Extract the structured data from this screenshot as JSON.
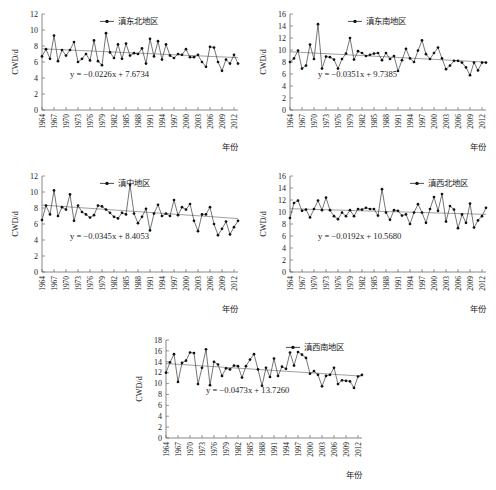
{
  "figure": {
    "background": "#ffffff",
    "axis_color": "#555555",
    "series_color": "#2b2b2b",
    "trend_color": "#777777",
    "marker_color": "#111111"
  },
  "common": {
    "ylabel": "CWD/d",
    "xlabel": "年份",
    "xtick_labels": [
      "1964",
      "1967",
      "1970",
      "1973",
      "1976",
      "1979",
      "1982",
      "1985",
      "1988",
      "1991",
      "1994",
      "1997",
      "2000",
      "2003",
      "2006",
      "2009",
      "2012"
    ],
    "xlim": [
      1964,
      2013
    ],
    "xtick_step": 3,
    "legend_marker": "line-with-dot-marker"
  },
  "chart_data": [
    {
      "id": "panel-1",
      "type": "line",
      "title": "",
      "legend": [
        "滇东北地区"
      ],
      "legend_position": "top-center",
      "xlabel": "年份",
      "ylabel": "CWD/d",
      "ylim": [
        0,
        12
      ],
      "ytick_labels": [
        "0",
        "2",
        "4",
        "6",
        "8",
        "10",
        "12"
      ],
      "ytick_step": 2,
      "grid": false,
      "equation": "y = −0.0226x + 7.6734",
      "trend": {
        "slope": -0.0226,
        "intercept": 7.6734,
        "x_origin": 1964
      },
      "x": [
        1964,
        1965,
        1966,
        1967,
        1968,
        1969,
        1970,
        1971,
        1972,
        1973,
        1974,
        1975,
        1976,
        1977,
        1978,
        1979,
        1980,
        1981,
        1982,
        1983,
        1984,
        1985,
        1986,
        1987,
        1988,
        1989,
        1990,
        1991,
        1992,
        1993,
        1994,
        1995,
        1996,
        1997,
        1998,
        1999,
        2000,
        2001,
        2002,
        2003,
        2004,
        2005,
        2006,
        2007,
        2008,
        2009,
        2010,
        2011,
        2012,
        2013
      ],
      "values": [
        6.7,
        7.6,
        6.4,
        9.3,
        6.1,
        7.5,
        6.8,
        7.5,
        8.5,
        6.0,
        6.4,
        7.0,
        6.2,
        8.7,
        6.1,
        5.6,
        9.6,
        7.2,
        6.5,
        8.2,
        6.4,
        8.3,
        6.8,
        7.1,
        7.0,
        7.7,
        5.8,
        8.9,
        6.7,
        8.6,
        6.3,
        8.2,
        6.8,
        6.5,
        7.0,
        6.9,
        7.6,
        6.6,
        6.6,
        6.9,
        6.0,
        5.4,
        7.9,
        7.8,
        6.0,
        4.9,
        6.3,
        5.8,
        6.9,
        5.8
      ]
    },
    {
      "id": "panel-2",
      "type": "line",
      "title": "",
      "legend": [
        "滇东南地区"
      ],
      "legend_position": "top-center",
      "xlabel": "年份",
      "ylabel": "CWD/d",
      "ylim": [
        0,
        16
      ],
      "ytick_labels": [
        "0",
        "2",
        "4",
        "6",
        "8",
        "10",
        "12",
        "14",
        "16"
      ],
      "ytick_step": 2,
      "grid": false,
      "equation": "y = −0.0351x + 9.7385",
      "trend": {
        "slope": -0.0351,
        "intercept": 9.7385,
        "x_origin": 1964
      },
      "x": [
        1964,
        1965,
        1966,
        1967,
        1968,
        1969,
        1970,
        1971,
        1972,
        1973,
        1974,
        1975,
        1976,
        1977,
        1978,
        1979,
        1980,
        1981,
        1982,
        1983,
        1984,
        1985,
        1986,
        1987,
        1988,
        1989,
        1990,
        1991,
        1992,
        1993,
        1994,
        1995,
        1996,
        1997,
        1998,
        1999,
        2000,
        2001,
        2002,
        2003,
        2004,
        2005,
        2006,
        2007,
        2008,
        2009,
        2010,
        2011,
        2012,
        2013
      ],
      "values": [
        8.0,
        8.6,
        9.9,
        6.9,
        7.4,
        10.9,
        8.5,
        14.3,
        6.9,
        8.9,
        8.8,
        8.4,
        6.9,
        8.5,
        9.4,
        12.0,
        8.4,
        9.8,
        9.5,
        9.0,
        9.2,
        9.4,
        9.5,
        8.3,
        9.5,
        8.5,
        9.0,
        6.5,
        8.3,
        10.2,
        8.6,
        8.0,
        9.9,
        11.6,
        9.3,
        8.5,
        9.5,
        10.4,
        8.6,
        6.8,
        7.4,
        8.2,
        8.2,
        7.9,
        7.1,
        5.8,
        7.9,
        6.6,
        7.9,
        7.9
      ]
    },
    {
      "id": "panel-3",
      "type": "line",
      "title": "",
      "legend": [
        "滇中地区"
      ],
      "legend_position": "top-center",
      "xlabel": "年份",
      "ylabel": "CWD/d",
      "ylim": [
        0,
        12
      ],
      "ytick_labels": [
        "0",
        "2",
        "4",
        "6",
        "8",
        "10",
        "12"
      ],
      "ytick_step": 2,
      "grid": false,
      "equation": "y = −0.0345x + 8.4053",
      "trend": {
        "slope": -0.0345,
        "intercept": 8.4053,
        "x_origin": 1964
      },
      "x": [
        1964,
        1965,
        1966,
        1967,
        1968,
        1969,
        1970,
        1971,
        1972,
        1973,
        1974,
        1975,
        1976,
        1977,
        1978,
        1979,
        1980,
        1981,
        1982,
        1983,
        1984,
        1985,
        1986,
        1987,
        1988,
        1989,
        1990,
        1991,
        1992,
        1993,
        1994,
        1995,
        1996,
        1997,
        1998,
        1999,
        2000,
        2001,
        2002,
        2003,
        2004,
        2005,
        2006,
        2007,
        2008,
        2009,
        2010,
        2011,
        2012,
        2013
      ],
      "values": [
        6.5,
        8.3,
        7.2,
        10.2,
        7.0,
        8.1,
        7.8,
        9.7,
        6.4,
        8.3,
        7.5,
        7.2,
        6.8,
        7.1,
        8.3,
        8.2,
        7.8,
        7.4,
        6.9,
        6.7,
        7.4,
        7.2,
        10.9,
        7.3,
        6.1,
        6.9,
        7.9,
        5.2,
        7.3,
        8.4,
        7.0,
        7.3,
        7.0,
        9.0,
        7.1,
        8.1,
        7.8,
        8.5,
        6.4,
        5.1,
        7.2,
        7.2,
        8.1,
        6.0,
        4.6,
        5.4,
        6.3,
        4.7,
        5.6,
        6.4
      ]
    },
    {
      "id": "panel-4",
      "type": "line",
      "title": "",
      "legend": [
        "滇西北地区"
      ],
      "legend_position": "top-right",
      "xlabel": "年份",
      "ylabel": "CWD/d",
      "ylim": [
        0,
        16
      ],
      "ytick_labels": [
        "0",
        "2",
        "4",
        "6",
        "8",
        "10",
        "12",
        "14",
        "16"
      ],
      "ytick_step": 2,
      "grid": false,
      "equation": "y = −0.0192x + 10.5680",
      "trend": {
        "slope": -0.0192,
        "intercept": 10.568,
        "x_origin": 1964
      },
      "x": [
        1964,
        1965,
        1966,
        1967,
        1968,
        1969,
        1970,
        1971,
        1972,
        1973,
        1974,
        1975,
        1976,
        1977,
        1978,
        1979,
        1980,
        1981,
        1982,
        1983,
        1984,
        1985,
        1986,
        1987,
        1988,
        1989,
        1990,
        1991,
        1992,
        1993,
        1994,
        1995,
        1996,
        1997,
        1998,
        1999,
        2000,
        2001,
        2002,
        2003,
        2004,
        2005,
        2006,
        2007,
        2008,
        2009,
        2010,
        2011,
        2012,
        2013
      ],
      "values": [
        9.0,
        11.5,
        11.9,
        10.2,
        10.4,
        9.1,
        10.5,
        11.9,
        10.3,
        12.4,
        10.3,
        9.3,
        8.8,
        9.9,
        9.3,
        10.3,
        9.3,
        10.5,
        10.4,
        10.7,
        10.5,
        10.5,
        9.4,
        13.8,
        9.9,
        8.7,
        10.3,
        10.2,
        9.4,
        9.6,
        8.0,
        9.9,
        11.3,
        9.9,
        8.2,
        10.5,
        12.5,
        10.2,
        13.0,
        8.4,
        11.0,
        10.4,
        7.3,
        9.6,
        8.2,
        11.4,
        7.4,
        8.6,
        9.3,
        10.7
      ]
    },
    {
      "id": "panel-5",
      "type": "line",
      "title": "",
      "legend": [
        "滇西南地区"
      ],
      "legend_position": "top-right",
      "xlabel": "年份",
      "ylabel": "CWD/d",
      "ylim": [
        0,
        18
      ],
      "ytick_labels": [
        "0",
        "2",
        "4",
        "6",
        "8",
        "10",
        "12",
        "14",
        "16",
        "18"
      ],
      "ytick_step": 2,
      "grid": false,
      "equation": "y = −0.0473x + 13.7260",
      "trend": {
        "slope": -0.0473,
        "intercept": 13.726,
        "x_origin": 1964
      },
      "x": [
        1964,
        1965,
        1966,
        1967,
        1968,
        1969,
        1970,
        1971,
        1972,
        1973,
        1974,
        1975,
        1976,
        1977,
        1978,
        1979,
        1980,
        1981,
        1982,
        1983,
        1984,
        1985,
        1986,
        1987,
        1988,
        1989,
        1990,
        1991,
        1992,
        1993,
        1994,
        1995,
        1996,
        1997,
        1998,
        1999,
        2000,
        2001,
        2002,
        2003,
        2004,
        2005,
        2006,
        2007,
        2008,
        2009,
        2010,
        2011,
        2012,
        2013
      ],
      "values": [
        12.0,
        13.9,
        15.4,
        10.3,
        13.8,
        14.2,
        15.7,
        15.6,
        9.9,
        12.9,
        16.3,
        9.7,
        14.0,
        13.5,
        11.4,
        12.8,
        12.6,
        13.3,
        13.2,
        11.1,
        13.2,
        14.4,
        15.4,
        12.6,
        9.6,
        12.9,
        11.2,
        14.6,
        11.4,
        13.1,
        12.7,
        15.7,
        13.3,
        15.8,
        15.3,
        14.7,
        11.8,
        12.3,
        11.6,
        9.5,
        11.4,
        11.6,
        12.9,
        9.9,
        10.6,
        10.5,
        10.4,
        9.2,
        11.3,
        11.6
      ]
    }
  ]
}
